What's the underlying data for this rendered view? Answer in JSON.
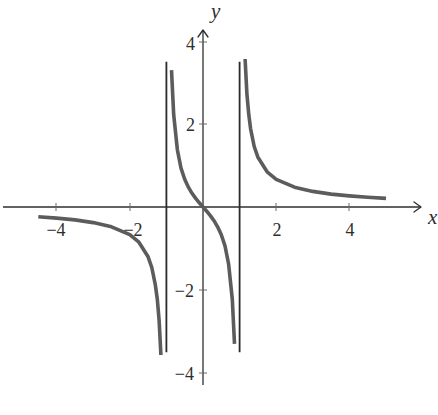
{
  "chart_data": {
    "type": "line",
    "title": "",
    "xlabel": "x",
    "ylabel": "y",
    "xlim": [
      -5.5,
      5.9
    ],
    "ylim": [
      -4.3,
      4.3
    ],
    "grid": false,
    "legend": null,
    "x_ticks": [
      {
        "value": -4,
        "label": "−4"
      },
      {
        "value": -2,
        "label": "−2"
      },
      {
        "value": 2,
        "label": "2"
      },
      {
        "value": 4,
        "label": "4"
      }
    ],
    "y_ticks": [
      {
        "value": 4,
        "label": "4"
      },
      {
        "value": 2,
        "label": "2"
      },
      {
        "value": -2,
        "label": "−2"
      },
      {
        "value": -4,
        "label": "−4"
      }
    ],
    "vertical_asymptotes": [
      {
        "x": -1,
        "y_from": -3.5,
        "y_to": 3.5
      },
      {
        "x": 1,
        "y_from": -3.5,
        "y_to": 3.5
      }
    ],
    "series": [
      {
        "name": "left-branch",
        "color": "#5c5c5c",
        "x": [
          -4.5,
          -4,
          -3.5,
          -3,
          -2.5,
          -2,
          -1.75,
          -1.5,
          -1.4,
          -1.3,
          -1.25,
          -1.2,
          -1.15
        ],
        "y": [
          -0.234,
          -0.267,
          -0.311,
          -0.375,
          -0.476,
          -0.667,
          -0.848,
          -1.2,
          -1.458,
          -1.884,
          -2.222,
          -2.727,
          -3.566
        ]
      },
      {
        "name": "middle-branch",
        "color": "#5c5c5c",
        "x": [
          -0.86,
          -0.8,
          -0.7,
          -0.6,
          -0.5,
          -0.4,
          -0.3,
          -0.2,
          -0.1,
          0,
          0.1,
          0.2,
          0.3,
          0.4,
          0.5,
          0.6,
          0.7,
          0.8,
          0.86
        ],
        "y": [
          3.3,
          2.222,
          1.373,
          0.938,
          0.667,
          0.476,
          0.33,
          0.208,
          0.101,
          0,
          -0.101,
          -0.208,
          -0.33,
          -0.476,
          -0.667,
          -0.938,
          -1.373,
          -2.222,
          -3.3
        ]
      },
      {
        "name": "right-branch",
        "color": "#5c5c5c",
        "x": [
          1.15,
          1.2,
          1.25,
          1.3,
          1.4,
          1.5,
          1.75,
          2,
          2.5,
          3,
          3.5,
          4,
          4.5,
          5
        ],
        "y": [
          3.566,
          2.727,
          2.222,
          1.884,
          1.458,
          1.2,
          0.848,
          0.667,
          0.476,
          0.375,
          0.311,
          0.267,
          0.234,
          0.208
        ]
      }
    ]
  },
  "labels": {
    "x_axis": "x",
    "y_axis": "y",
    "x_tick_m4": "−4",
    "x_tick_m2": "−2",
    "x_tick_2": "2",
    "x_tick_4": "4",
    "y_tick_4": "4",
    "y_tick_2": "2",
    "y_tick_m2": "−2",
    "y_tick_m4": "−4"
  }
}
